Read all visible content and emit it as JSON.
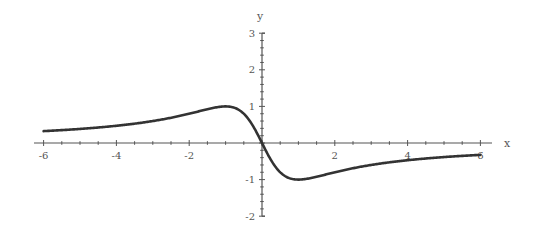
{
  "chart_data": {
    "type": "line",
    "title": "",
    "xlabel": "x",
    "ylabel": "y",
    "xlim": [
      -6,
      6
    ],
    "ylim": [
      -2,
      3
    ],
    "grid": false,
    "legend": null,
    "function": "y = -2x / (1 + x^2)",
    "x_ticks": [
      -6,
      -4,
      -2,
      2,
      4,
      6
    ],
    "y_ticks": [
      -2,
      -1,
      1,
      2,
      3
    ],
    "x_tick_labels": [
      "-6",
      "-4",
      "-2",
      "2",
      "4",
      "6"
    ],
    "y_tick_labels": [
      "-2",
      "-1",
      "1",
      "2",
      "3"
    ],
    "series": [
      {
        "name": "curve",
        "color": "#333333",
        "x": [
          -6,
          -5,
          -4,
          -3,
          -2,
          -1.5,
          -1,
          -0.5,
          0,
          0.5,
          1,
          1.5,
          2,
          3,
          4,
          5,
          6
        ],
        "values": [
          0.32,
          0.38,
          0.47,
          0.6,
          0.8,
          0.92,
          1.0,
          0.8,
          0,
          -0.8,
          -1.0,
          -0.92,
          -0.8,
          -0.6,
          -0.47,
          -0.38,
          -0.32
        ]
      }
    ]
  },
  "colors": {
    "axis": "#555555",
    "curve": "#333333",
    "background": "#ffffff"
  }
}
